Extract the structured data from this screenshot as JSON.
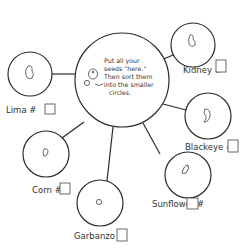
{
  "diagram": {
    "type": "seed-sorting-mat",
    "colors": {
      "ink": "#2b2b2b",
      "paper": "#ffffff"
    },
    "center": {
      "instruction_lines": [
        "Put all your",
        "seeds \"here.\"",
        "Then sort them",
        "into the smaller",
        "circles."
      ],
      "mascot": "seed-character-icon"
    },
    "categories": [
      {
        "id": "lima",
        "label": "Lima #",
        "seed_icon": "lima-bean-icon",
        "count": ""
      },
      {
        "id": "kidney",
        "label": "Kidney #",
        "seed_icon": "kidney-bean-icon",
        "count": ""
      },
      {
        "id": "blackeye",
        "label": "Blackeye #",
        "seed_icon": "blackeye-pea-icon",
        "count": ""
      },
      {
        "id": "sunflower",
        "label": "Sunflower #",
        "seed_icon": "sunflower-seed-icon",
        "count": ""
      },
      {
        "id": "garbanzo",
        "label": "Garbanzo #",
        "seed_icon": "garbanzo-bean-icon",
        "count": ""
      },
      {
        "id": "corn",
        "label": "Corn #",
        "seed_icon": "corn-kernel-icon",
        "count": ""
      }
    ]
  }
}
